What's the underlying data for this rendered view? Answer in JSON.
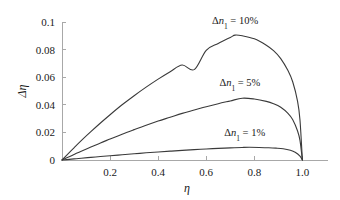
{
  "chart_data": {
    "type": "line",
    "title": "",
    "xlabel": "η",
    "ylabel": "Δη",
    "xlim": [
      0,
      1.04
    ],
    "ylim": [
      0,
      0.1
    ],
    "grid": false,
    "legend_position": "inline-annotations",
    "xticks": [
      "0.2",
      "0.4",
      "0.6",
      "0.8",
      "1.0"
    ],
    "xtick_values": [
      0.2,
      0.4,
      0.6,
      0.8,
      1.0
    ],
    "yticks": [
      "0",
      "0.02",
      "0.04",
      "0.06",
      "0.08",
      "0.1"
    ],
    "ytick_values": [
      0,
      0.02,
      0.04,
      0.06,
      0.08,
      0.1
    ],
    "series": [
      {
        "name": "Δn₁ = 10%",
        "color": "#3a3a3a",
        "peak_x": 0.72,
        "peak_y": 0.0905,
        "x": [
          0.0,
          0.02,
          0.05,
          0.08,
          0.12,
          0.16,
          0.2,
          0.25,
          0.3,
          0.35,
          0.4,
          0.45,
          0.5,
          0.55,
          0.6,
          0.65,
          0.7,
          0.72,
          0.75,
          0.8,
          0.85,
          0.88,
          0.91,
          0.94,
          0.96,
          0.98,
          0.99,
          1.0
        ],
        "values": [
          0.0,
          0.0035,
          0.0088,
          0.014,
          0.0205,
          0.0268,
          0.0328,
          0.04,
          0.0466,
          0.0528,
          0.0586,
          0.064,
          0.0688,
          0.0655,
          0.0795,
          0.0845,
          0.0888,
          0.0905,
          0.09,
          0.0878,
          0.0832,
          0.0792,
          0.0735,
          0.0648,
          0.0565,
          0.0425,
          0.029,
          0.0
        ]
      },
      {
        "name": "Δn₁ = 5%",
        "color": "#3a3a3a",
        "peak_x": 0.75,
        "peak_y": 0.0448,
        "x": [
          0.0,
          0.02,
          0.05,
          0.08,
          0.12,
          0.16,
          0.2,
          0.25,
          0.3,
          0.35,
          0.4,
          0.45,
          0.5,
          0.55,
          0.6,
          0.65,
          0.7,
          0.75,
          0.8,
          0.85,
          0.88,
          0.91,
          0.94,
          0.96,
          0.98,
          0.99,
          1.0
        ],
        "values": [
          0.0,
          0.0016,
          0.004,
          0.0064,
          0.0094,
          0.0124,
          0.0152,
          0.0187,
          0.022,
          0.0252,
          0.0282,
          0.031,
          0.0338,
          0.0362,
          0.0386,
          0.0408,
          0.0428,
          0.0448,
          0.0442,
          0.0425,
          0.0408,
          0.0382,
          0.0338,
          0.0292,
          0.021,
          0.0142,
          0.0
        ]
      },
      {
        "name": "Δn₁ = 1%",
        "color": "#3a3a3a",
        "peak_x": 0.78,
        "peak_y": 0.0092,
        "x": [
          0.0,
          0.02,
          0.05,
          0.08,
          0.12,
          0.16,
          0.2,
          0.25,
          0.3,
          0.35,
          0.4,
          0.45,
          0.5,
          0.55,
          0.6,
          0.65,
          0.7,
          0.75,
          0.78,
          0.82,
          0.86,
          0.89,
          0.92,
          0.95,
          0.97,
          0.99,
          1.0
        ],
        "values": [
          0.0,
          0.0003,
          0.0008,
          0.0013,
          0.0019,
          0.0025,
          0.0031,
          0.0038,
          0.0045,
          0.0052,
          0.0058,
          0.0064,
          0.007,
          0.0075,
          0.008,
          0.0084,
          0.0088,
          0.0091,
          0.0092,
          0.0091,
          0.0089,
          0.0086,
          0.0081,
          0.007,
          0.0056,
          0.0028,
          0.0
        ]
      }
    ],
    "annotations": [
      {
        "text": "Δn₁ = 10%",
        "x": 0.72,
        "y": 0.0985,
        "series": 0
      },
      {
        "text": "Δn₁ = 5%",
        "x": 0.74,
        "y": 0.0535,
        "series": 1
      },
      {
        "text": "Δn₁ = 1%",
        "x": 0.76,
        "y": 0.0175,
        "series": 2
      }
    ]
  }
}
